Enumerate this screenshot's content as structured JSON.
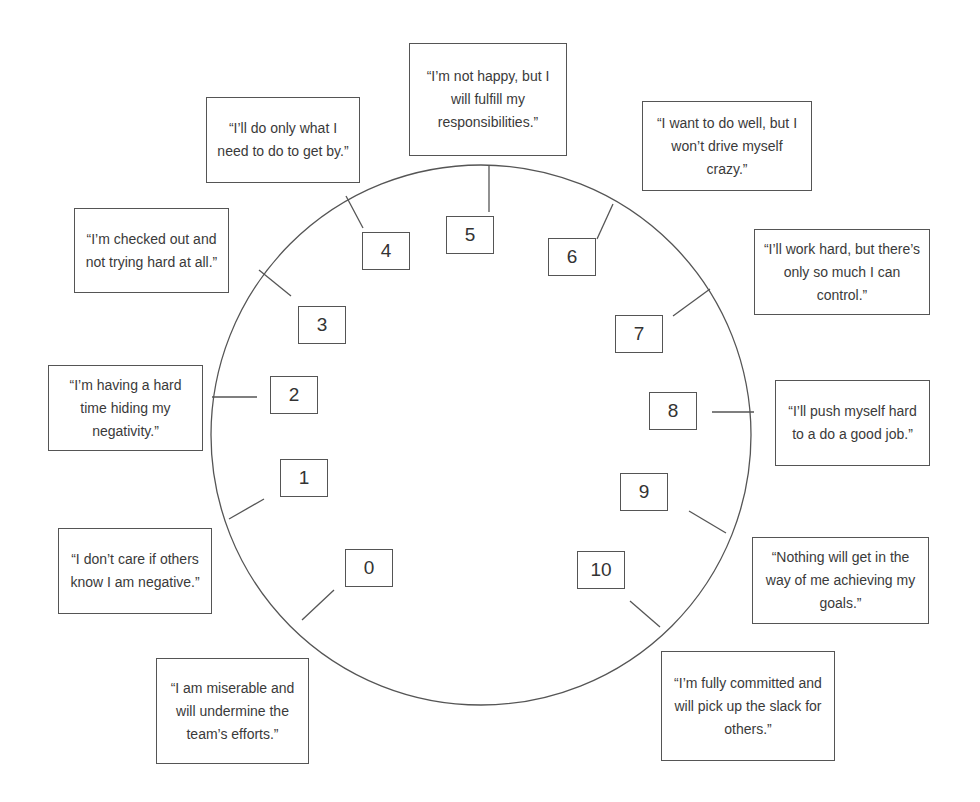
{
  "diagram": {
    "type": "engagement-scale-dial",
    "scale": [
      {
        "value": "0",
        "quote": "“I am miserable and will undermine the team’s efforts.”"
      },
      {
        "value": "1",
        "quote": "“I don’t care if others know I am negative.”"
      },
      {
        "value": "2",
        "quote": "“I’m having a hard time hiding my negativity.”"
      },
      {
        "value": "3",
        "quote": "“I’m checked out and not trying hard at all.”"
      },
      {
        "value": "4",
        "quote": "“I’ll do only what I need to do to get by.”"
      },
      {
        "value": "5",
        "quote": "“I’m not happy, but I will fulfill my responsibilities.”"
      },
      {
        "value": "6",
        "quote": "“I want to do well, but I won’t drive myself crazy.”"
      },
      {
        "value": "7",
        "quote": "“I’ll work hard, but there’s only so much I can control.”"
      },
      {
        "value": "8",
        "quote": "“I’ll push myself hard to a do a good job.”"
      },
      {
        "value": "9",
        "quote": "“Nothing will get in the way of me achieving my goals.”"
      },
      {
        "value": "10",
        "quote": "“I’m fully committed and will pick up the slack for others.”"
      }
    ],
    "colors": {
      "line": "#555555",
      "text": "#3a3a3a",
      "background": "#ffffff"
    }
  }
}
